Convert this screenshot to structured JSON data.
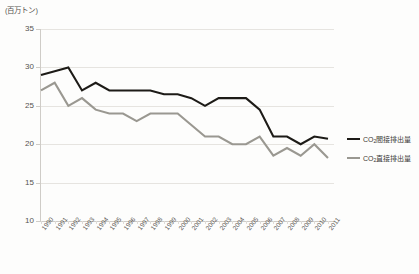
{
  "chart_data": {
    "type": "line",
    "title": "",
    "subtitle": "",
    "unit_label": "(百万トン)",
    "xlabel": "",
    "ylabel": "",
    "ylim": [
      10,
      35
    ],
    "ytick_values": [
      10,
      15,
      20,
      25,
      30,
      35
    ],
    "ytick_labels": [
      "10",
      "15",
      "20",
      "25",
      "30",
      "35"
    ],
    "grid": true,
    "grid_axis": "y",
    "legend_position": "right",
    "x": [
      1990,
      1991,
      1992,
      1993,
      1994,
      1995,
      1996,
      1997,
      1998,
      1999,
      2000,
      2001,
      2002,
      2003,
      2004,
      2005,
      2006,
      2007,
      2008,
      2009,
      2010,
      2011
    ],
    "categories": [
      "1990",
      "1991",
      "1992",
      "1993",
      "1994",
      "1995",
      "1996",
      "1997",
      "1998",
      "1999",
      "2000",
      "2001",
      "2002",
      "2003",
      "2004",
      "2005",
      "2006",
      "2007",
      "2008",
      "2009",
      "2010",
      "2011"
    ],
    "series": [
      {
        "name": "CO2間接排出量",
        "name_base": "CO",
        "name_sub": "2",
        "name_rest": "間接排出量",
        "color": "#1d1b17",
        "values": [
          29.0,
          29.5,
          30.0,
          27.0,
          28.0,
          27.0,
          27.0,
          27.0,
          27.0,
          26.5,
          26.5,
          26.0,
          25.0,
          26.0,
          26.0,
          26.0,
          24.5,
          21.0,
          21.0,
          20.0,
          21.0,
          20.7
        ]
      },
      {
        "name": "CO2直接排出量",
        "name_base": "CO",
        "name_sub": "2",
        "name_rest": "直接排出量",
        "color": "#9a9891",
        "values": [
          27.0,
          28.0,
          25.0,
          26.0,
          24.5,
          24.0,
          24.0,
          23.0,
          24.0,
          24.0,
          24.0,
          22.5,
          21.0,
          21.0,
          20.0,
          20.0,
          21.0,
          18.5,
          19.5,
          18.5,
          20.0,
          18.2
        ]
      }
    ]
  },
  "legend": {
    "items": [
      {
        "label_base": "CO",
        "label_sub": "2",
        "label_rest": "間接排出量",
        "color": "#1d1b17"
      },
      {
        "label_base": "CO",
        "label_sub": "2",
        "label_rest": "直接排出量",
        "color": "#9a9891"
      }
    ]
  }
}
